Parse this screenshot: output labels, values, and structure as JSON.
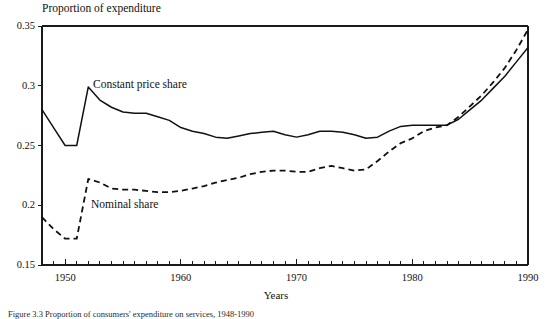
{
  "figure": {
    "title": "Proportion of expenditure",
    "x_axis_label": "Years",
    "caption": "Figure 3.3 Proportion of consumers' expenditure on services, 1948-1990"
  },
  "labels": {
    "constant": "Constant price share",
    "nominal": "Nominal share"
  },
  "chart_data": {
    "type": "line",
    "title": "Proportion of expenditure",
    "xlabel": "Years",
    "ylabel": "Proportion of expenditure",
    "xlim": [
      1948,
      1990
    ],
    "ylim": [
      0.15,
      0.35
    ],
    "yticks": [
      "0.15",
      "0.2",
      "0.25",
      "0.3",
      "0.35"
    ],
    "ytick_values": [
      0.15,
      0.2,
      0.25,
      0.3,
      0.35
    ],
    "xticks": [
      "1950",
      "1960",
      "1970",
      "1980",
      "1990"
    ],
    "xtick_values": [
      1950,
      1960,
      1970,
      1980,
      1990
    ],
    "minor_xtick_interval": 1,
    "grid": false,
    "legend": "inline-annotations",
    "x": [
      1948,
      1949,
      1950,
      1951,
      1952,
      1953,
      1954,
      1955,
      1956,
      1957,
      1958,
      1959,
      1960,
      1961,
      1962,
      1963,
      1964,
      1965,
      1966,
      1967,
      1968,
      1969,
      1970,
      1971,
      1972,
      1973,
      1974,
      1975,
      1976,
      1977,
      1978,
      1979,
      1980,
      1981,
      1982,
      1983,
      1984,
      1985,
      1986,
      1987,
      1988,
      1989,
      1990
    ],
    "series": [
      {
        "name": "Constant price share",
        "style": "solid",
        "color": "#111111",
        "values": [
          0.28,
          0.265,
          0.25,
          0.25,
          0.299,
          0.288,
          0.282,
          0.278,
          0.277,
          0.277,
          0.274,
          0.271,
          0.265,
          0.262,
          0.26,
          0.257,
          0.256,
          0.258,
          0.26,
          0.261,
          0.262,
          0.259,
          0.257,
          0.259,
          0.262,
          0.262,
          0.261,
          0.259,
          0.256,
          0.257,
          0.262,
          0.266,
          0.267,
          0.267,
          0.267,
          0.267,
          0.272,
          0.28,
          0.288,
          0.298,
          0.308,
          0.32,
          0.332
        ]
      },
      {
        "name": "Nominal share",
        "style": "dashed",
        "color": "#111111",
        "values": [
          0.19,
          0.18,
          0.172,
          0.172,
          0.222,
          0.219,
          0.214,
          0.213,
          0.213,
          0.212,
          0.211,
          0.211,
          0.212,
          0.214,
          0.216,
          0.219,
          0.221,
          0.223,
          0.226,
          0.228,
          0.229,
          0.229,
          0.228,
          0.228,
          0.231,
          0.233,
          0.231,
          0.229,
          0.23,
          0.237,
          0.245,
          0.252,
          0.256,
          0.262,
          0.265,
          0.267,
          0.274,
          0.283,
          0.292,
          0.303,
          0.315,
          0.33,
          0.347
        ]
      }
    ],
    "annotations": [
      {
        "text": "Constant price share",
        "x": 1952,
        "y": 0.299
      },
      {
        "text": "Nominal share",
        "x": 1952,
        "y": 0.222
      }
    ]
  }
}
